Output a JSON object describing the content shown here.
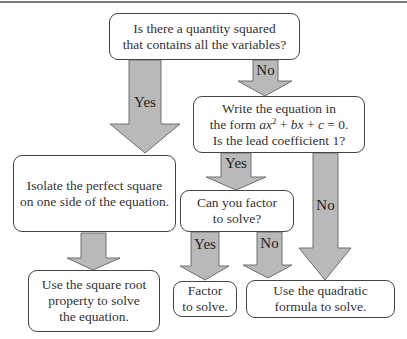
{
  "diagram": {
    "type": "flowchart",
    "colors": {
      "arrow_fill": "#b9b9b9",
      "arrow_stroke": "#6e6e6e",
      "box_border": "#444444"
    },
    "nodes": {
      "q1": {
        "text": "Is there a quantity squared\nthat contains all the variables?"
      },
      "q2": {
        "line1": "Write the equation in",
        "line2_prefix": "the form ",
        "a": "ax",
        "sup": "2",
        "plus_b": " + ",
        "b": "bx",
        "plus_c": " + ",
        "c": "c",
        "eq": " = 0.",
        "line3": "Is the lead coefficient 1?"
      },
      "isolate": {
        "text": "Isolate the perfect square\non one side of the equation."
      },
      "q3": {
        "text": "Can you factor\nto solve?"
      },
      "sqroot": {
        "text": "Use the square root\nproperty to solve\nthe equation."
      },
      "factor": {
        "text": "Factor\nto solve."
      },
      "quadratic": {
        "text": "Use the quadratic\nformula to solve."
      }
    },
    "edges": [
      {
        "from": "q1",
        "to": "isolate",
        "label": "Yes"
      },
      {
        "from": "q1",
        "to": "q2",
        "label": "No"
      },
      {
        "from": "q2",
        "to": "q3",
        "label": "Yes"
      },
      {
        "from": "q2",
        "to": "quadratic",
        "label": "No"
      },
      {
        "from": "isolate",
        "to": "sqroot",
        "label": ""
      },
      {
        "from": "q3",
        "to": "factor",
        "label": "Yes"
      },
      {
        "from": "q3",
        "to": "quadratic",
        "label": "No"
      }
    ]
  }
}
